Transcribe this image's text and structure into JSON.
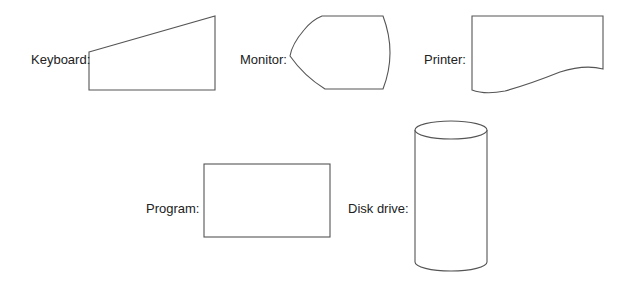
{
  "symbols": [
    {
      "label": "Keyboard:",
      "shape": "manual-input"
    },
    {
      "label": "Monitor:",
      "shape": "display"
    },
    {
      "label": "Printer:",
      "shape": "document"
    },
    {
      "label": "Program:",
      "shape": "process"
    },
    {
      "label": "Disk drive:",
      "shape": "cylinder"
    }
  ]
}
